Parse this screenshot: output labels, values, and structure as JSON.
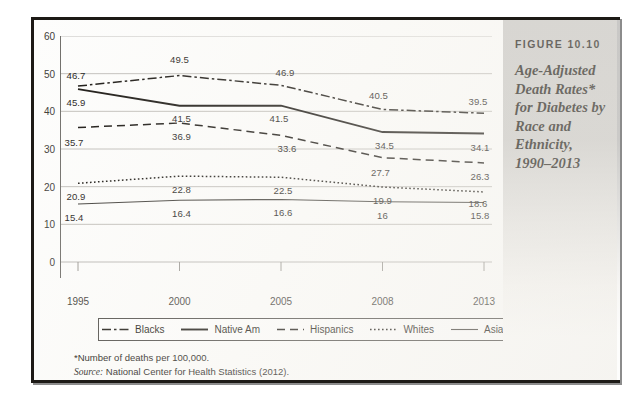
{
  "figure": {
    "number": "FIGURE 10.10",
    "caption": "Age-Adjusted Death Rates* for Diabetes by Race and Ethnicity, 1990–2013"
  },
  "footnotes": {
    "asterisk": "*Number of deaths per 100,000.",
    "source_word": "Source:",
    "source_text": " National Center for Health Statistics (2012)."
  },
  "chart_data": {
    "type": "line",
    "title": "Age-Adjusted Death Rates* for Diabetes by Race and Ethnicity, 1990–2013",
    "xlabel": "",
    "ylabel": "",
    "categories": [
      "1995",
      "2000",
      "2005",
      "2008",
      "2013"
    ],
    "ylim": [
      0,
      60
    ],
    "yticks": [
      0,
      10,
      20,
      30,
      40,
      50,
      60
    ],
    "grid": true,
    "legend_position": "bottom",
    "series": [
      {
        "name": "Blacks",
        "style": "dash-dot",
        "color": "#16130f",
        "values": [
          46.7,
          49.5,
          46.9,
          40.5,
          39.5
        ],
        "labels": [
          "46.7",
          "49.5",
          "46.9",
          "40.5",
          "39.5"
        ]
      },
      {
        "name": "Native Am",
        "style": "solid",
        "color": "#16130f",
        "values": [
          45.9,
          41.5,
          41.5,
          34.5,
          34.1
        ],
        "labels": [
          "45.9",
          "41.5",
          "41.5",
          "34.5",
          "34.1"
        ]
      },
      {
        "name": "Hispanics",
        "style": "dashed",
        "color": "#16130f",
        "values": [
          35.7,
          36.9,
          33.6,
          27.7,
          26.3
        ],
        "labels": [
          "35.7",
          "36.9",
          "33.6",
          "27.7",
          "26.3"
        ]
      },
      {
        "name": "Whites",
        "style": "dotted",
        "color": "#16130f",
        "values": [
          20.9,
          22.8,
          22.5,
          19.9,
          18.6
        ],
        "labels": [
          "20.9",
          "22.8",
          "22.5",
          "19.9",
          "18.6"
        ]
      },
      {
        "name": "Asians",
        "style": "solid-thin",
        "color": "#3c3a36",
        "values": [
          15.4,
          16.4,
          16.6,
          16.0,
          15.8
        ],
        "labels": [
          "15.4",
          "16.4",
          "16.6",
          "16",
          "15.8"
        ]
      }
    ]
  }
}
